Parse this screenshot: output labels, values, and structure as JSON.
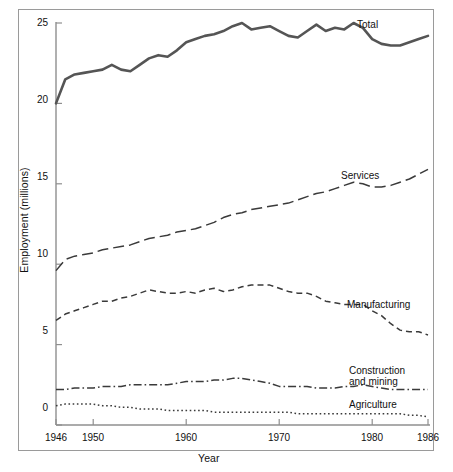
{
  "chart_data": {
    "type": "line",
    "title": "",
    "xlabel": "Year",
    "ylabel": "Employment (millions)",
    "xlim": [
      1946,
      1986
    ],
    "ylim": [
      0,
      25
    ],
    "grid": false,
    "legend_position": "inline-right-of-series",
    "x_ticks": [
      1946,
      1950,
      1960,
      1970,
      1980,
      1986
    ],
    "y_ticks": [
      0,
      5,
      10,
      15,
      20,
      25
    ],
    "x": [
      1946,
      1947,
      1948,
      1949,
      1950,
      1951,
      1952,
      1953,
      1954,
      1955,
      1956,
      1957,
      1958,
      1959,
      1960,
      1961,
      1962,
      1963,
      1964,
      1965,
      1966,
      1967,
      1968,
      1969,
      1970,
      1971,
      1972,
      1973,
      1974,
      1975,
      1976,
      1977,
      1978,
      1979,
      1980,
      1981,
      1982,
      1983,
      1984,
      1985,
      1986
    ],
    "series": [
      {
        "name": "Total",
        "line_style": "solid",
        "values": [
          20.0,
          21.5,
          21.8,
          21.9,
          22.0,
          22.1,
          22.4,
          22.1,
          22.0,
          22.4,
          22.8,
          23.0,
          22.9,
          23.3,
          23.8,
          24.0,
          24.2,
          24.3,
          24.5,
          24.8,
          25.0,
          24.6,
          24.7,
          24.8,
          24.5,
          24.2,
          24.1,
          24.5,
          24.9,
          24.5,
          24.7,
          24.6,
          25.0,
          24.7,
          24.0,
          23.7,
          23.6,
          23.6,
          23.8,
          24.0,
          24.2
        ]
      },
      {
        "name": "Services",
        "line_style": "dashed-long",
        "values": [
          9.6,
          10.3,
          10.5,
          10.6,
          10.7,
          10.9,
          11.0,
          11.1,
          11.2,
          11.4,
          11.6,
          11.7,
          11.8,
          12.0,
          12.1,
          12.2,
          12.4,
          12.6,
          12.9,
          13.1,
          13.2,
          13.4,
          13.5,
          13.6,
          13.7,
          13.8,
          14.0,
          14.2,
          14.4,
          14.5,
          14.7,
          14.9,
          15.1,
          15.0,
          14.8,
          14.8,
          14.9,
          15.1,
          15.3,
          15.6,
          15.9
        ]
      },
      {
        "name": "Manufacturing",
        "line_style": "dashed-medium",
        "values": [
          6.5,
          6.9,
          7.1,
          7.3,
          7.5,
          7.7,
          7.7,
          7.9,
          8.0,
          8.2,
          8.4,
          8.3,
          8.2,
          8.2,
          8.3,
          8.2,
          8.4,
          8.5,
          8.3,
          8.4,
          8.6,
          8.7,
          8.7,
          8.7,
          8.5,
          8.3,
          8.2,
          8.2,
          8.0,
          7.7,
          7.6,
          7.5,
          7.5,
          7.5,
          7.1,
          6.8,
          6.3,
          5.9,
          5.8,
          5.8,
          5.6
        ]
      },
      {
        "name": "Construction and mining",
        "line_style": "dash-dot",
        "values": [
          2.2,
          2.2,
          2.3,
          2.3,
          2.3,
          2.4,
          2.4,
          2.4,
          2.5,
          2.5,
          2.5,
          2.5,
          2.5,
          2.6,
          2.7,
          2.7,
          2.7,
          2.8,
          2.8,
          2.9,
          2.9,
          2.8,
          2.7,
          2.6,
          2.4,
          2.4,
          2.4,
          2.4,
          2.3,
          2.3,
          2.3,
          2.4,
          2.4,
          2.5,
          2.4,
          2.3,
          2.2,
          2.2,
          2.2,
          2.2,
          2.2
        ]
      },
      {
        "name": "Agriculture",
        "line_style": "dotted",
        "values": [
          1.2,
          1.3,
          1.3,
          1.3,
          1.3,
          1.2,
          1.2,
          1.1,
          1.1,
          1.0,
          1.0,
          1.0,
          0.9,
          0.9,
          0.9,
          0.9,
          0.9,
          0.8,
          0.8,
          0.8,
          0.8,
          0.8,
          0.8,
          0.8,
          0.8,
          0.8,
          0.7,
          0.7,
          0.7,
          0.7,
          0.7,
          0.7,
          0.7,
          0.7,
          0.7,
          0.7,
          0.7,
          0.7,
          0.6,
          0.6,
          0.5
        ]
      }
    ],
    "annotations": [
      {
        "text": "Total",
        "x": 1979,
        "y": 25.0
      },
      {
        "text": "Services",
        "x": 1977,
        "y": 15.6
      },
      {
        "text": "Manufacturing",
        "x": 1978,
        "y": 7.2
      },
      {
        "text": "Construction",
        "x": 1977,
        "y": 3.1
      },
      {
        "text": "and mining",
        "x": 1977,
        "y": 2.75
      },
      {
        "text": "Agriculture",
        "x": 1978,
        "y": 1.25
      }
    ]
  },
  "axes": {
    "y_title": "Employment (millions)",
    "x_title": "Year",
    "y_tick_labels": [
      "0",
      "5",
      "10",
      "15",
      "20",
      "25"
    ],
    "x_tick_labels": [
      "1946",
      "1950",
      "1960",
      "1970",
      "1980",
      "1986"
    ]
  },
  "colors": {
    "line": "#3a3a3a",
    "total_line": "#555555",
    "axis": "#8f8f8f",
    "frame": "#9a9a9a",
    "text": "#111111",
    "background": "#ffffff"
  }
}
